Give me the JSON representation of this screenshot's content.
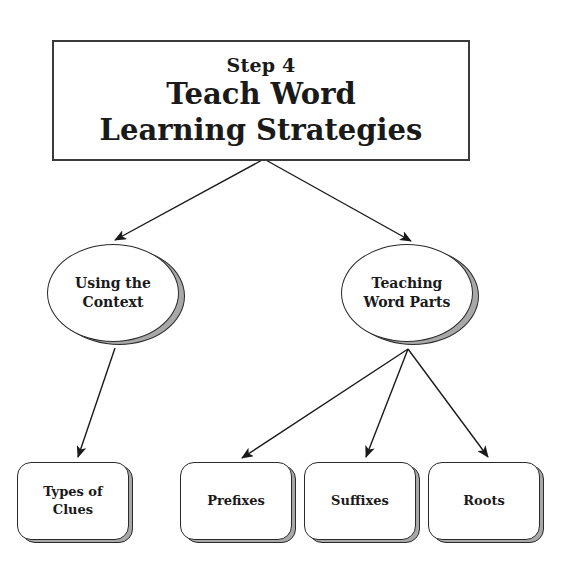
{
  "title": {
    "step": "Step 4",
    "line1": "Teach Word",
    "line2": "Learning Strategies"
  },
  "branches": [
    {
      "id": "context",
      "lines": [
        "Using the",
        "Context"
      ]
    },
    {
      "id": "word-parts",
      "lines": [
        "Teaching",
        "Word Parts"
      ]
    }
  ],
  "leaves": [
    {
      "id": "types-of-clues",
      "parent": "context",
      "lines": [
        "Types of",
        "Clues"
      ]
    },
    {
      "id": "prefixes",
      "parent": "word-parts",
      "lines": [
        "Prefixes"
      ]
    },
    {
      "id": "suffixes",
      "parent": "word-parts",
      "lines": [
        "Suffixes"
      ]
    },
    {
      "id": "roots",
      "parent": "word-parts",
      "lines": [
        "Roots"
      ]
    }
  ],
  "colors": {
    "stroke": "#2a2a2a",
    "shadow": "#a8a8a8",
    "fill": "#ffffff"
  }
}
